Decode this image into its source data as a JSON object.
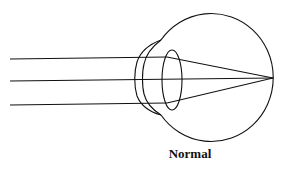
{
  "diagram": {
    "title": "Normal",
    "stroke_color": "#111111",
    "background": "#ffffff"
  }
}
